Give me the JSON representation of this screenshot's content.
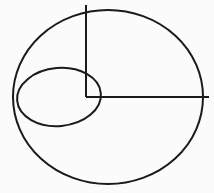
{
  "figure": {
    "background_color": "#fbfbfb",
    "stroke_color": "#1a1a1a",
    "canvas": {
      "width": 214,
      "height": 193
    },
    "title": "",
    "caption": "",
    "shapes": [
      {
        "name": "large-ellipse",
        "type": "ellipse",
        "cx": 108,
        "cy": 97,
        "rx": 95,
        "ry": 87,
        "rotation": 0,
        "stroke_width": 2.0
      },
      {
        "name": "small-ellipse",
        "type": "ellipse",
        "cx": 59,
        "cy": 97,
        "rx": 42,
        "ry": 29,
        "rotation": -5,
        "stroke_width": 2.0
      },
      {
        "name": "vertical-radius-line",
        "type": "line",
        "x1": 86,
        "y1": 5,
        "x2": 86,
        "y2": 97,
        "stroke_width": 2.0
      },
      {
        "name": "horizontal-radius-line",
        "type": "line",
        "x1": 86,
        "y1": 97,
        "x2": 209,
        "y2": 97,
        "stroke_width": 2.0
      }
    ],
    "labels": []
  }
}
